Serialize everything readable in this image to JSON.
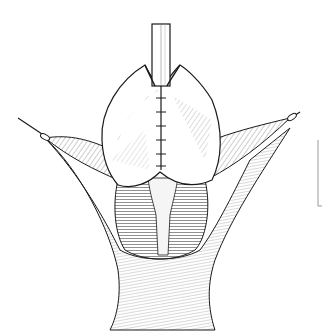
{
  "figure": {
    "style": "black-and-white surgical line illustration",
    "background": "#ffffff",
    "ink": "#1a1a1a",
    "elements": [
      "catheter-tube",
      "bilobed-flap",
      "midline-suture-line",
      "left-retracted-flap",
      "right-retracted-flap",
      "left-retractor-hook",
      "right-retractor-hook",
      "central-tissue-pedicle",
      "muscle-bed",
      "lower-skin-fold",
      "scale-bracket"
    ],
    "sutures_count": 6
  }
}
